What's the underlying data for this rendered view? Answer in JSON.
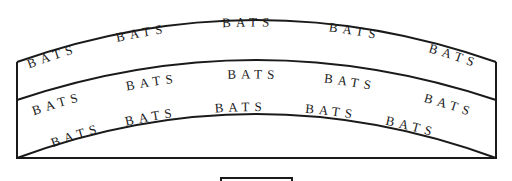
{
  "diagram": {
    "type": "arched-band-layout",
    "bands": [
      {
        "name": "top-band",
        "labels": [
          "BATS",
          "BATS",
          "BATS",
          "BATS",
          "BATS"
        ]
      },
      {
        "name": "middle-band",
        "labels": [
          "BATS",
          "BATS",
          "BATS",
          "BATS",
          "BATS"
        ]
      },
      {
        "name": "bottom-band",
        "labels": [
          "BATS",
          "BATS",
          "BATS",
          "BATS",
          "BATS",
          "BATS"
        ]
      }
    ],
    "colors": {
      "line": "#1a1a1a",
      "background": "#ffffff",
      "text": "#1a1a1a"
    }
  }
}
